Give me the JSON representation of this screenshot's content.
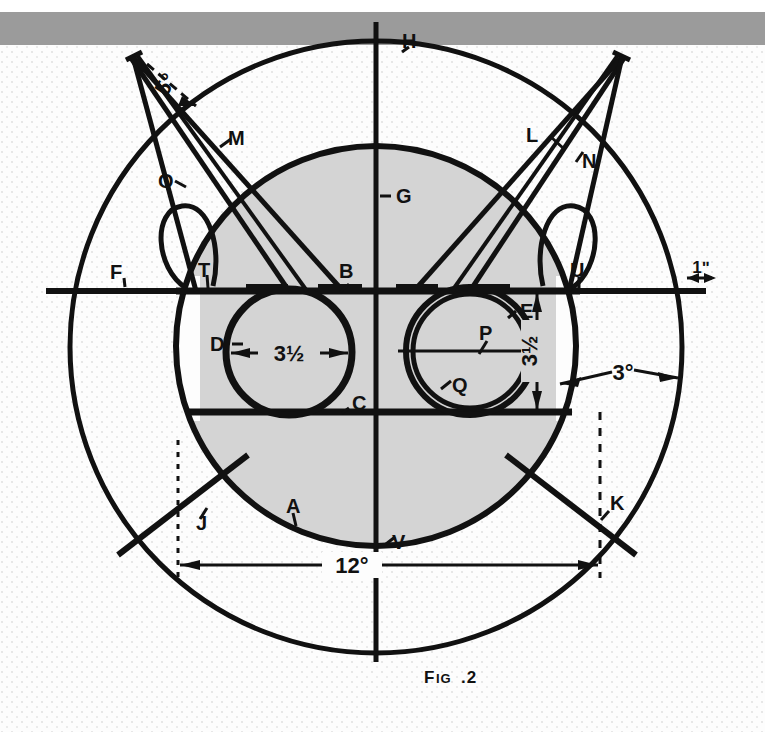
{
  "figure": {
    "caption_main": "F",
    "caption_small": "IG",
    "caption_tail": ".2",
    "caption_full": "Fig.2",
    "kind": "engineering-line-drawing",
    "colors": {
      "ink": "#111111",
      "shading": "#d4d4d4",
      "paper": "#fdfdfd",
      "top_band": "#9b9b9b"
    }
  },
  "dimensions": [
    {
      "id": "dim-bore-left",
      "value": "3½",
      "orientation": "horizontal",
      "note": "left bore diameter"
    },
    {
      "id": "dim-bore-right",
      "value": "3½",
      "orientation": "vertical",
      "note": "right bore diameter"
    },
    {
      "id": "dim-overall",
      "value": "12°",
      "orientation": "horizontal",
      "note": "overall span across figure"
    },
    {
      "id": "dim-edge",
      "value": "3°",
      "orientation": "horizontal",
      "note": "rim to outer circle"
    },
    {
      "id": "dim-inch",
      "value": "1ʺ",
      "orientation": "horizontal",
      "note": "right edge offset"
    },
    {
      "id": "dim-angle",
      "value": "5°",
      "orientation": "diagonal",
      "note": "pointer tip angle, left"
    }
  ],
  "callouts": [
    {
      "id": "callout-a",
      "label": "A"
    },
    {
      "id": "callout-b",
      "label": "B"
    },
    {
      "id": "callout-c",
      "label": "C"
    },
    {
      "id": "callout-d",
      "label": "D"
    },
    {
      "id": "callout-e",
      "label": "E"
    },
    {
      "id": "callout-f",
      "label": "F"
    },
    {
      "id": "callout-g",
      "label": "G"
    },
    {
      "id": "callout-h",
      "label": "H"
    },
    {
      "id": "callout-j",
      "label": "J"
    },
    {
      "id": "callout-k",
      "label": "K"
    },
    {
      "id": "callout-l",
      "label": "L"
    },
    {
      "id": "callout-m",
      "label": "M"
    },
    {
      "id": "callout-n",
      "label": "N"
    },
    {
      "id": "callout-o",
      "label": "O"
    },
    {
      "id": "callout-p",
      "label": "P"
    },
    {
      "id": "callout-q",
      "label": "Q"
    },
    {
      "id": "callout-t",
      "label": "T"
    },
    {
      "id": "callout-u",
      "label": "U"
    },
    {
      "id": "callout-v",
      "label": "V"
    }
  ]
}
